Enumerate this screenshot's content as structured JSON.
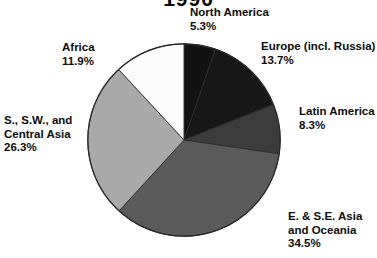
{
  "chart_data": {
    "type": "pie",
    "title": "1990",
    "title_note": "title is cropped off at the top edge of the screenshot; only the lower fragments of the digits are visible",
    "categories": [
      "North America",
      "Europe (incl. Russia)",
      "Latin America",
      "E. & S.E. Asia and Oceania",
      "S., S.W., and Central Asia",
      "Africa"
    ],
    "values": [
      5.3,
      13.7,
      8.3,
      34.5,
      26.3,
      11.9
    ],
    "value_suffix": "%",
    "xlabel": "",
    "ylabel": "",
    "legend_position": "none",
    "grid": false,
    "start_angle_deg": 0,
    "direction": "clockwise",
    "slice_colors": [
      "#121212",
      "#171717",
      "#3c3c3c",
      "#5b5b5b",
      "#a9a9a9",
      "#fbfbfb"
    ],
    "slice_outline": "#2b2b2b"
  },
  "labels": {
    "north_america": {
      "name": "North America",
      "pct": "5.3%"
    },
    "europe": {
      "name": "Europe (incl. Russia)",
      "pct": "13.7%"
    },
    "latin_america": {
      "name": "Latin America",
      "pct": "8.3%"
    },
    "east_asia": {
      "name_line1": "E. & S.E. Asia",
      "name_line2": "and Oceania",
      "pct": "34.5%"
    },
    "south_central_asia": {
      "name_line1": "S., S.W., and",
      "name_line2": "Central Asia",
      "pct": "26.3%"
    },
    "africa": {
      "name": "Africa",
      "pct": "11.9%"
    }
  }
}
